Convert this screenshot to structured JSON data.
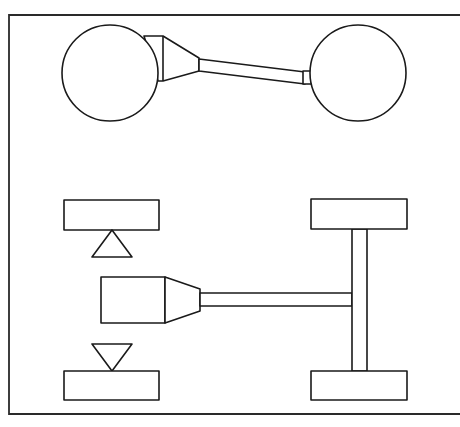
{
  "diagram": {
    "title": "",
    "colors": {
      "stroke": "#1a1a1a",
      "fill": "#ffffff",
      "frame": "#2a2a2a"
    },
    "frame": {
      "x": 9,
      "y": 15,
      "right_open": true,
      "bottom": 414
    },
    "top_view": {
      "left_circle": {
        "cx": 110,
        "cy": 73,
        "r": 48
      },
      "right_circle": {
        "cx": 358,
        "cy": 73,
        "r": 48
      },
      "connector": "tapered cone joining left circle to shaft",
      "shaft": "long rod from cone to right circle with small collar"
    },
    "bottom_view": {
      "left_upper_block": {
        "x": 64,
        "y": 200,
        "w": 95,
        "h": 30
      },
      "upper_triangle": "pointing up, under upper-left block",
      "left_lower_block": {
        "x": 64,
        "y": 371,
        "w": 95,
        "h": 29
      },
      "lower_triangle": "pointing down, above lower-left block",
      "body": {
        "x": 101,
        "y": 277,
        "w": 64,
        "h": 46
      },
      "nozzle": "tapered section from body to shaft",
      "shaft": "horizontal rod to vertical axle",
      "axle": "vertical bar connecting two right blocks",
      "right_upper_block": {
        "x": 311,
        "y": 199,
        "w": 96,
        "h": 30
      },
      "right_lower_block": {
        "x": 311,
        "y": 371,
        "w": 96,
        "h": 29
      }
    }
  }
}
